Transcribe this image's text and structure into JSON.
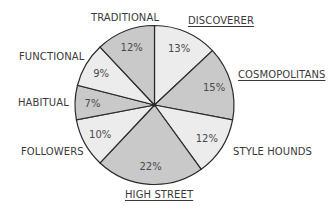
{
  "chart_data": {
    "type": "pie",
    "title": "",
    "start_angle": "12 o'clock",
    "direction": "clockwise",
    "slices": [
      {
        "label": "DISCOVERER",
        "value": 13,
        "value_label": "13%",
        "highlighted": true,
        "shade": "light"
      },
      {
        "label": "COSMOPOLITANS",
        "value": 15,
        "value_label": "15%",
        "highlighted": true,
        "shade": "dark"
      },
      {
        "label": "STYLE HOUNDS",
        "value": 12,
        "value_label": "12%",
        "highlighted": false,
        "shade": "light"
      },
      {
        "label": "HIGH STREET",
        "value": 22,
        "value_label": "22%",
        "highlighted": true,
        "shade": "dark"
      },
      {
        "label": "FOLLOWERS",
        "value": 10,
        "value_label": "10%",
        "highlighted": false,
        "shade": "light"
      },
      {
        "label": "HABITUAL",
        "value": 7,
        "value_label": "7%",
        "highlighted": false,
        "shade": "dark"
      },
      {
        "label": "FUNCTIONAL",
        "value": 9,
        "value_label": "9%",
        "highlighted": false,
        "shade": "light"
      },
      {
        "label": "TRADITIONAL",
        "value": 12,
        "value_label": "12%",
        "highlighted": false,
        "shade": "dark"
      }
    ],
    "colors": {
      "light": "#ececec",
      "dark": "#c9c9c9",
      "stroke": "#2a2a2a",
      "text": "#3a3a3a"
    },
    "legend": "none (labels placed outside slices; highlighted labels underlined)"
  }
}
